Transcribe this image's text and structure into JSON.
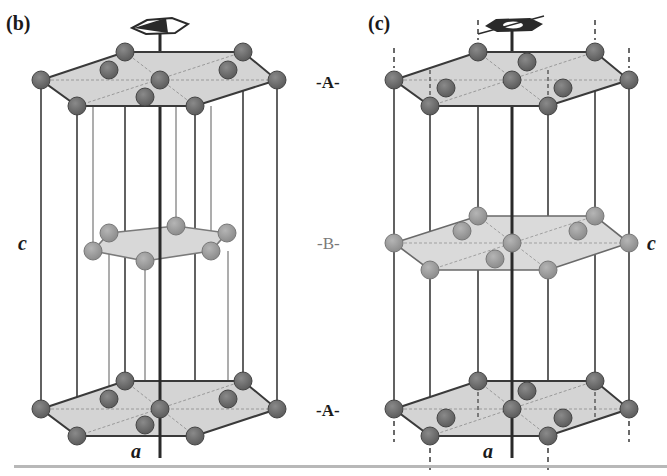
{
  "figure": {
    "colors": {
      "atom_dark": "#6e6e6e",
      "atom_light": "#9a9a9a",
      "plane_fill": "#d4d4d4",
      "line": "#3a3a3a",
      "axis": "#2a2a2a"
    }
  },
  "panels": [
    {
      "id": "b",
      "label": "(b)",
      "axis_label_c": "c",
      "axis_label_a": "a",
      "layers": [
        "A",
        "B",
        "A"
      ]
    },
    {
      "id": "c",
      "label": "(c)",
      "axis_label_c": "c",
      "axis_label_a": "a",
      "layers": [
        "A",
        "B",
        "A"
      ]
    }
  ],
  "layer_labels": {
    "top": "-A-",
    "middle": "-B-",
    "bottom": "-A-"
  }
}
